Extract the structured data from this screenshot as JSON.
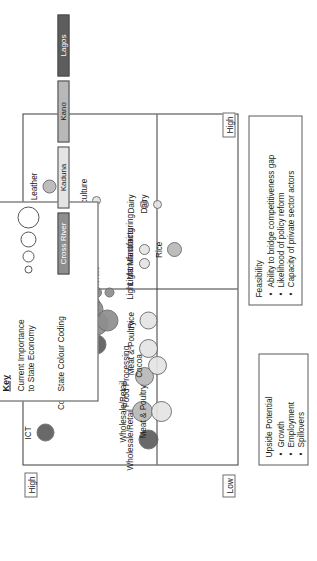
{
  "chart_data": {
    "type": "scatter",
    "title": "",
    "xlabel": "Feasibility",
    "ylabel": "Upside Potential",
    "x_axis_low_label": "Low",
    "x_axis_high_label": "High",
    "y_axis_high_label": "High",
    "grid": false,
    "xlim": [
      0,
      100
    ],
    "ylim": [
      0,
      100
    ],
    "bubbles": [
      {
        "label": "ICT",
        "x": 9,
        "y": 90,
        "size": 18,
        "state": "Lagos"
      },
      {
        "label": "Construction",
        "x": 22,
        "y": 74,
        "size": 20,
        "state": "Lagos"
      },
      {
        "label": "Light Manufacturing",
        "x": 34,
        "y": 66,
        "size": 20,
        "state": "Lagos"
      },
      {
        "label": "Oil Palm",
        "x": 40,
        "y": 66,
        "size": 24,
        "state": "Cross River"
      },
      {
        "label": "Tourism",
        "x": 44,
        "y": 68,
        "size": 22,
        "state": "Cross River"
      },
      {
        "label": "Food Processing",
        "x": 46,
        "y": 70,
        "size": 22,
        "state": "Lagos"
      },
      {
        "label": "Cocoa",
        "x": 41,
        "y": 61,
        "size": 22,
        "state": "Cross River"
      },
      {
        "label": "Calabar Port",
        "x": 49,
        "y": 66,
        "size": 11,
        "state": "Cross River"
      },
      {
        "label": "Solid Minerals",
        "x": 49,
        "y": 60,
        "size": 10,
        "state": "Cross River"
      },
      {
        "label": "Leather",
        "x": 79,
        "y": 88,
        "size": 14,
        "state": "Kano"
      },
      {
        "label": "Aquaculture",
        "x": 75,
        "y": 66,
        "size": 9,
        "state": "Kaduna"
      },
      {
        "label": "Wholesale/Retail",
        "x": 7,
        "y": 42,
        "size": 20,
        "state": "Lagos"
      },
      {
        "label": "Wholesale/Retail",
        "x": 15,
        "y": 45,
        "size": 21,
        "state": "Kano"
      },
      {
        "label": "Meat & Poultry",
        "x": 15,
        "y": 36,
        "size": 21,
        "state": "Kaduna"
      },
      {
        "label": "Food Processing",
        "x": 25,
        "y": 44,
        "size": 19,
        "state": "Kano"
      },
      {
        "label": "Cocoa",
        "x": 28,
        "y": 38,
        "size": 19,
        "state": "Kaduna"
      },
      {
        "label": "Meat & Poultry",
        "x": 33,
        "y": 42,
        "size": 19,
        "state": "Kaduna"
      },
      {
        "label": "Rice",
        "x": 41,
        "y": 42,
        "size": 18,
        "state": "Kaduna"
      },
      {
        "label": "Light Manufacturing",
        "x": 57,
        "y": 44,
        "size": 11,
        "state": "Kaduna"
      },
      {
        "label": "Light Manufacturing",
        "x": 61,
        "y": 44,
        "size": 11,
        "state": "Kaduna"
      },
      {
        "label": "Rice",
        "x": 61,
        "y": 30,
        "size": 15,
        "state": "Kano"
      },
      {
        "label": "Dairy",
        "x": 74,
        "y": 44,
        "size": 9,
        "state": "Kaduna"
      },
      {
        "label": "Dairy",
        "x": 74,
        "y": 38,
        "size": 9,
        "state": "Kaduna"
      }
    ]
  },
  "axes": {
    "upside_potential": {
      "title": "Upside Potential",
      "bullets": [
        "Growth",
        "Employment",
        "Spillovers"
      ],
      "high_marker": "High"
    },
    "feasibility": {
      "title": "Feasibility",
      "bullets": [
        "Ability to bridge competitiveness gap",
        "Likelihood of policy reform",
        "Capacity of private sector actors"
      ],
      "low_marker": "Low",
      "high_marker": "High"
    }
  },
  "key": {
    "title": "Key",
    "size_legend_label": "Current Importance\nto State Economy",
    "colour_legend_label": "State Colour Coding",
    "size_steps": [
      6,
      10,
      14,
      20
    ],
    "states": [
      {
        "name": "Cross River",
        "color": "#8e8e8e"
      },
      {
        "name": "Kaduna",
        "color": "#e4e4e4"
      },
      {
        "name": "Kano",
        "color": "#b8b8b8"
      },
      {
        "name": "Lagos",
        "color": "#5d5d5d"
      }
    ]
  }
}
